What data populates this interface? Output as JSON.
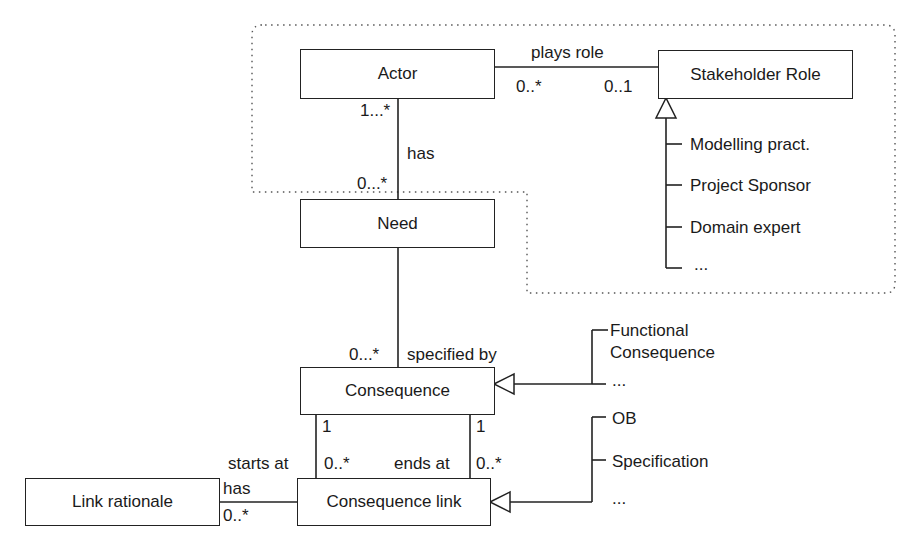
{
  "classes": {
    "actor": "Actor",
    "stakeholder_role": "Stakeholder Role",
    "need": "Need",
    "consequence": "Consequence",
    "consequence_link": "Consequence link",
    "link_rationale": "Link rationale"
  },
  "associations": {
    "plays_role": {
      "label": "plays role",
      "mult_actor": "0..*",
      "mult_role": "0..1"
    },
    "has_need": {
      "label": "has",
      "mult_actor": "1...*",
      "mult_need": "0...*"
    },
    "specified_by": {
      "label": "specified by",
      "mult": "0...*"
    },
    "starts_at": {
      "label": "starts at",
      "mult_top": "1",
      "mult_bottom": "0..*"
    },
    "ends_at": {
      "label": "ends at",
      "mult_top": "1",
      "mult_bottom": "0..*"
    },
    "has_rationale": {
      "label": "has",
      "mult": "0..*"
    }
  },
  "stakeholder_subtypes": [
    "Modelling pract.",
    "Project Sponsor",
    "Domain expert",
    "..."
  ],
  "consequence_subtypes": [
    "Functional",
    "Consequence",
    "..."
  ],
  "link_subtypes": [
    "OB",
    "Specification",
    "..."
  ]
}
